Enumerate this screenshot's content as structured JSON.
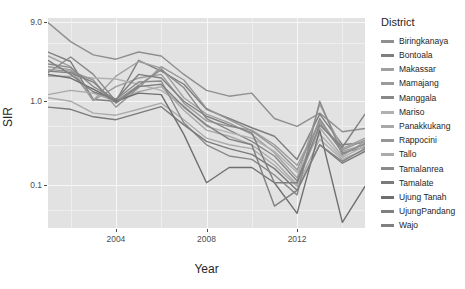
{
  "chart_data": {
    "type": "line",
    "title": "",
    "xlabel": "Year",
    "ylabel": "SIR",
    "y_scale": "log10",
    "ylim": [
      0.03,
      10.0
    ],
    "xlim": [
      2001,
      2015
    ],
    "grid": true,
    "legend_position": "right",
    "legend_title": "District",
    "y_ticks": [
      {
        "value": 9.0,
        "label": "9.0"
      },
      {
        "value": 1.0,
        "label": "1.0"
      },
      {
        "value": 0.1,
        "label": "0.1"
      }
    ],
    "x_ticks": [
      {
        "value": 2004,
        "label": "2004"
      },
      {
        "value": 2008,
        "label": "2008"
      },
      {
        "value": 2012,
        "label": "2012"
      }
    ],
    "x": [
      2001,
      2002,
      2003,
      2004,
      2005,
      2006,
      2007,
      2008,
      2009,
      2010,
      2011,
      2012,
      2013,
      2014,
      2015
    ],
    "series": [
      {
        "name": "Biringkanaya",
        "color": "#8f8f8f",
        "values": [
          8.8,
          5.2,
          3.6,
          3.2,
          3.9,
          3.5,
          2.1,
          1.35,
          1.15,
          1.25,
          0.62,
          0.5,
          0.72,
          0.43,
          0.47
        ]
      },
      {
        "name": "Bontoala",
        "color": "#7e7e7e",
        "values": [
          3.9,
          3.0,
          1.05,
          1.0,
          3.1,
          2.3,
          1.6,
          0.8,
          0.62,
          0.48,
          0.38,
          0.2,
          0.7,
          0.3,
          0.32
        ]
      },
      {
        "name": "Makassar",
        "color": "#a0a0a0",
        "values": [
          3.5,
          2.6,
          1.02,
          2.0,
          3.0,
          2.5,
          1.1,
          0.7,
          0.55,
          0.4,
          0.24,
          0.12,
          0.92,
          0.27,
          0.36
        ]
      },
      {
        "name": "Mamajang",
        "color": "#9a9a9a",
        "values": [
          2.6,
          2.4,
          1.02,
          1.5,
          1.9,
          2.1,
          0.95,
          0.58,
          0.5,
          0.45,
          0.3,
          0.17,
          0.55,
          0.25,
          0.3
        ]
      },
      {
        "name": "Manggala",
        "color": "#888888",
        "values": [
          2.2,
          3.4,
          2.1,
          1.0,
          1.55,
          2.4,
          1.45,
          0.62,
          0.45,
          0.33,
          0.22,
          0.11,
          0.62,
          0.24,
          0.28
        ]
      },
      {
        "name": "Mariso",
        "color": "#b0b0b0",
        "values": [
          2.0,
          2.0,
          1.9,
          1.85,
          1.6,
          1.35,
          0.88,
          0.5,
          0.42,
          0.36,
          0.25,
          0.14,
          0.4,
          0.21,
          0.29
        ]
      },
      {
        "name": "Panakkukang",
        "color": "#a8a8a8",
        "values": [
          1.2,
          1.35,
          1.25,
          1.0,
          1.3,
          1.5,
          0.78,
          0.45,
          0.38,
          0.3,
          0.19,
          0.1,
          0.48,
          0.22,
          0.33
        ]
      },
      {
        "name": "Rappocini",
        "color": "#969696",
        "values": [
          2.4,
          2.3,
          1.8,
          0.85,
          1.45,
          2.6,
          1.8,
          0.82,
          0.6,
          0.44,
          0.28,
          0.15,
          0.58,
          0.26,
          0.34
        ]
      },
      {
        "name": "Tallo",
        "color": "#ababab",
        "values": [
          1.1,
          1.0,
          0.72,
          0.68,
          0.8,
          0.95,
          0.6,
          0.36,
          0.3,
          0.27,
          0.17,
          0.095,
          0.35,
          0.2,
          0.26
        ]
      },
      {
        "name": "Tamalanrea",
        "color": "#8a8a8a",
        "values": [
          2.8,
          2.55,
          1.5,
          1.05,
          1.7,
          1.75,
          0.55,
          0.3,
          0.22,
          0.2,
          0.13,
          0.075,
          1.0,
          0.23,
          0.31
        ]
      },
      {
        "name": "Tamalate",
        "color": "#7a7a7a",
        "values": [
          0.85,
          0.8,
          0.65,
          0.6,
          0.72,
          0.86,
          0.52,
          0.33,
          0.27,
          0.23,
          0.155,
          0.085,
          0.3,
          0.18,
          0.25
        ]
      },
      {
        "name": "Ujung Tanah",
        "color": "#6f6f6f",
        "values": [
          2.1,
          1.9,
          1.4,
          1.0,
          1.25,
          1.2,
          0.4,
          0.105,
          0.16,
          0.16,
          0.105,
          0.045,
          0.45,
          0.035,
          0.095
        ]
      },
      {
        "name": "UjungPandang",
        "color": "#7f7f7f",
        "values": [
          3.1,
          2.1,
          1.3,
          1.05,
          2.1,
          1.9,
          1.0,
          0.66,
          0.52,
          0.42,
          0.105,
          0.105,
          0.52,
          0.28,
          0.7
        ]
      },
      {
        "name": "Wajo",
        "color": "#808080",
        "values": [
          2.3,
          2.2,
          1.7,
          0.95,
          1.5,
          1.6,
          0.85,
          0.52,
          0.35,
          0.3,
          0.055,
          0.085,
          0.3,
          0.19,
          0.27
        ]
      }
    ]
  },
  "axes": {
    "x_title": "Year",
    "y_title": "SIR"
  },
  "legend": {
    "title": "District"
  }
}
